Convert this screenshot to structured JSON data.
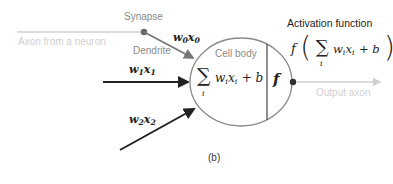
{
  "diagram": {
    "labels": {
      "synapse": "Synapse",
      "axon_from_neuron": "Axon from a neuron",
      "dendrite": "Dendrite",
      "cell_body": "Cell body",
      "activation_function": "Activation function",
      "output_axon": "Output axon",
      "caption": "(b)"
    },
    "inputs": [
      {
        "w": "w",
        "w_sub": "0",
        "x": "x",
        "x_sub": "0"
      },
      {
        "w": "w",
        "w_sub": "1",
        "x": "x",
        "x_sub": "1"
      },
      {
        "w": "w",
        "w_sub": "2",
        "x": "x",
        "x_sub": "2"
      }
    ],
    "cell_body_formula": {
      "sum": "∑",
      "index": "i",
      "term": "w",
      "term_sub": "i",
      "x": "x",
      "x_sub": "i",
      "bias": "+ b"
    },
    "activation_symbol": "f",
    "activation_formula": {
      "f": "f",
      "open": "(",
      "sum": "∑",
      "index": "i",
      "term": "w",
      "term_sub": "i",
      "x": "x",
      "x_sub": "i",
      "bias": "+ b",
      "close": ")"
    },
    "colors": {
      "line_dark": "#222222",
      "line_gray": "#888888",
      "line_light": "#d0d0d0",
      "ellipse": "#8a8a8a"
    }
  }
}
